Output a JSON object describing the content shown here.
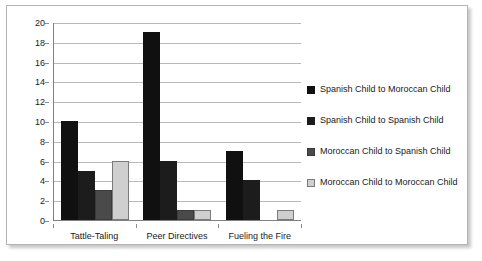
{
  "chart_data": {
    "type": "bar",
    "title": "",
    "xlabel": "",
    "ylabel": "",
    "ylim": [
      0,
      20
    ],
    "ytick_step": 2,
    "yticks": [
      20,
      18,
      16,
      14,
      12,
      10,
      8,
      6,
      4,
      2,
      0
    ],
    "grid": true,
    "legend_position": "right",
    "categories": [
      "Tattle-Taling",
      "Peer Directives",
      "Fueling the Fire"
    ],
    "series": [
      {
        "name": "Spanish Child to Moroccan Child",
        "color": "#101010",
        "border": "#101010",
        "values": [
          10,
          19,
          7
        ]
      },
      {
        "name": "Spanish Child to Spanish Child",
        "color": "#1c1c1c",
        "border": "#1c1c1c",
        "values": [
          5,
          6,
          4
        ]
      },
      {
        "name": "Moroccan Child to Spanish Child",
        "color": "#4a4a4a",
        "border": "#3a3a3a",
        "values": [
          3,
          1,
          0
        ]
      },
      {
        "name": "Moroccan Child to Moroccan Child",
        "color": "#cfcfcf",
        "border": "#7a7a7a",
        "values": [
          6,
          1,
          1
        ]
      }
    ]
  },
  "frame": {
    "border_color": "#b4b4b4",
    "background": "#ffffff"
  },
  "axis": {
    "line_color": "#808080",
    "gridline_color": "#b9b9b9"
  }
}
